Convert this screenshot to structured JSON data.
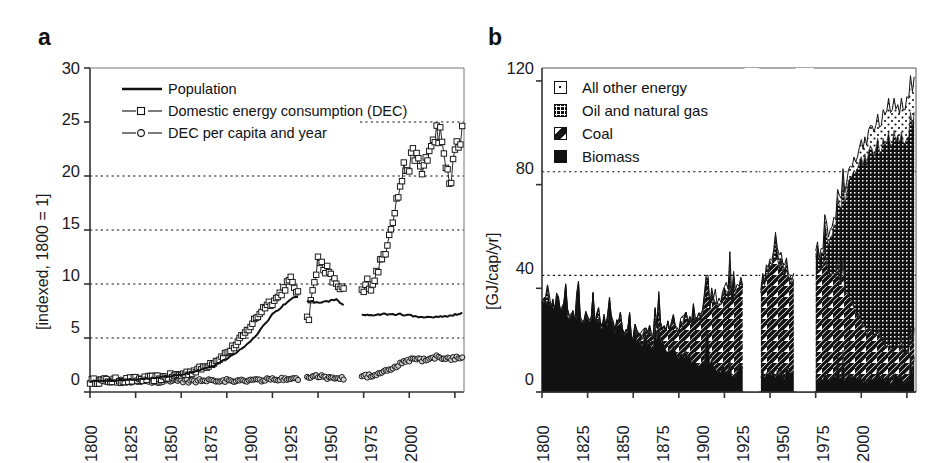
{
  "figure": {
    "panels": [
      {
        "label": "a"
      },
      {
        "label": "b"
      }
    ]
  },
  "chart_data": [
    {
      "panel": "a",
      "type": "line",
      "title": "",
      "xlabel": "",
      "ylabel": "[indexed, 1800 = 1]",
      "xlim": [
        1800,
        2005
      ],
      "ylim": [
        0,
        30
      ],
      "xticks": [
        1800,
        1825,
        1850,
        1875,
        1900,
        1925,
        1950,
        1975,
        2000
      ],
      "yticks": [
        0,
        5,
        10,
        15,
        20,
        25,
        30
      ],
      "grid": "horizontal dotted at 5, 10, 15, 20, 25",
      "legend_position": "top-left inside",
      "series": [
        {
          "name": "Population",
          "marker": "none",
          "style": "solid line",
          "x": [
            1800,
            1810,
            1820,
            1830,
            1840,
            1850,
            1860,
            1870,
            1880,
            1890,
            1900,
            1910,
            1913,
            1920,
            1925,
            1930,
            1935,
            1938,
            1950,
            1955,
            1960,
            1965,
            1970,
            1975,
            1980,
            1985,
            1990,
            1995,
            2000,
            2004
          ],
          "values": [
            1.0,
            1.05,
            1.12,
            1.22,
            1.38,
            1.6,
            2.0,
            2.6,
            3.6,
            5.0,
            7.2,
            8.6,
            8.9,
            8.4,
            8.3,
            8.4,
            8.6,
            8.1,
            7.1,
            7.15,
            7.2,
            7.2,
            7.2,
            7.1,
            6.95,
            6.9,
            6.95,
            7.0,
            7.15,
            7.35
          ]
        },
        {
          "name": "Domestic energy consumption (DEC)",
          "marker": "open square",
          "style": "line with markers",
          "x": [
            1800,
            1810,
            1820,
            1830,
            1840,
            1850,
            1860,
            1870,
            1875,
            1880,
            1885,
            1890,
            1893,
            1896,
            1899,
            1902,
            1905,
            1908,
            1910,
            1913,
            1920,
            1922,
            1924,
            1925,
            1926,
            1928,
            1930,
            1932,
            1934,
            1936,
            1938,
            1950,
            1952,
            1954,
            1956,
            1958,
            1960,
            1962,
            1964,
            1966,
            1968,
            1970,
            1972,
            1974,
            1976,
            1978,
            1980,
            1982,
            1984,
            1986,
            1988,
            1990,
            1992,
            1994,
            1996,
            1998,
            2000,
            2002,
            2004
          ],
          "values": [
            1.0,
            1.05,
            1.1,
            1.2,
            1.35,
            1.6,
            2.1,
            3.0,
            3.6,
            4.4,
            5.4,
            6.6,
            7.3,
            8.0,
            8.3,
            8.6,
            9.3,
            10.0,
            10.3,
            9.5,
            6.8,
            9.8,
            10.6,
            12.3,
            12.1,
            11.6,
            11.3,
            10.6,
            10.2,
            9.9,
            9.5,
            9.3,
            10.2,
            9.7,
            10.5,
            11.5,
            12.2,
            13.2,
            14.8,
            16.2,
            17.6,
            19.0,
            20.6,
            20.9,
            21.3,
            22.3,
            21.0,
            20.3,
            21.6,
            22.2,
            22.8,
            24.2,
            23.8,
            21.4,
            20.4,
            19.3,
            22.5,
            23.0,
            23.8
          ]
        },
        {
          "name": "DEC per capita and year",
          "marker": "open circle",
          "style": "line with markers",
          "x": [
            1800,
            1810,
            1820,
            1830,
            1840,
            1850,
            1860,
            1870,
            1880,
            1890,
            1900,
            1910,
            1913,
            1920,
            1925,
            1930,
            1935,
            1938,
            1950,
            1955,
            1960,
            1965,
            1970,
            1975,
            1980,
            1985,
            1990,
            1995,
            2000,
            2004
          ],
          "values": [
            1.0,
            1.0,
            1.0,
            1.0,
            1.0,
            1.0,
            1.05,
            1.12,
            1.0,
            1.1,
            1.15,
            1.2,
            1.2,
            1.3,
            1.5,
            1.35,
            1.3,
            1.25,
            1.45,
            1.55,
            1.75,
            2.1,
            2.6,
            2.95,
            3.0,
            2.95,
            3.25,
            3.05,
            3.15,
            3.3
          ]
        }
      ]
    },
    {
      "panel": "b",
      "type": "area",
      "subtype": "stacked area",
      "title": "",
      "xlabel": "",
      "ylabel": "[GJ/cap/yr]",
      "xlim": [
        1800,
        2005
      ],
      "ylim": [
        0,
        125
      ],
      "xticks": [
        1800,
        1825,
        1850,
        1875,
        1900,
        1925,
        1950,
        1975,
        2000
      ],
      "yticks": [
        0,
        40,
        80,
        120
      ],
      "grid": "horizontal dotted at 45 and 85",
      "legend_position": "top-left inside",
      "data_gaps": [
        [
          1911,
          1919
        ],
        [
          1939,
          1949
        ]
      ],
      "series": [
        {
          "name": "Biomass",
          "pattern": "solid black",
          "x": [
            1800,
            1805,
            1810,
            1815,
            1820,
            1825,
            1830,
            1835,
            1840,
            1845,
            1850,
            1855,
            1860,
            1865,
            1870,
            1875,
            1880,
            1885,
            1890,
            1895,
            1900,
            1905,
            1910,
            1920,
            1925,
            1930,
            1935,
            1938,
            1950,
            1955,
            1960,
            1965,
            1970,
            1975,
            1980,
            1985,
            1990,
            1995,
            2000,
            2004
          ],
          "values": [
            36,
            34,
            33,
            30,
            29,
            28,
            27,
            26,
            25,
            23,
            21,
            20,
            19,
            18,
            16,
            15,
            13,
            12,
            11,
            10,
            9,
            8,
            8,
            7,
            7,
            7,
            7,
            7,
            6,
            6,
            6,
            5.5,
            5.5,
            5,
            5,
            5,
            5,
            5,
            5,
            5
          ]
        },
        {
          "name": "Coal",
          "pattern": "diagonal hatch",
          "x": [
            1800,
            1810,
            1820,
            1830,
            1840,
            1850,
            1855,
            1860,
            1865,
            1870,
            1875,
            1880,
            1885,
            1890,
            1895,
            1900,
            1905,
            1910,
            1920,
            1925,
            1928,
            1930,
            1935,
            1938,
            1950,
            1955,
            1960,
            1965,
            1970,
            1975,
            1980,
            1985,
            1990,
            1995,
            2000,
            2004
          ],
          "values": [
            0,
            0,
            0,
            0,
            0,
            1,
            2,
            4,
            6,
            8,
            11,
            14,
            17,
            20,
            24,
            28,
            30,
            32,
            33,
            40,
            45,
            42,
            36,
            34,
            42,
            43,
            40,
            34,
            28,
            22,
            18,
            15,
            13,
            11,
            10,
            10
          ]
        },
        {
          "name": "Oil and natural gas",
          "pattern": "dense dot grid",
          "x": [
            1800,
            1850,
            1900,
            1910,
            1920,
            1930,
            1938,
            1950,
            1955,
            1960,
            1965,
            1970,
            1975,
            1980,
            1985,
            1990,
            1995,
            2000,
            2004
          ],
          "values": [
            0,
            0,
            0.5,
            1,
            1,
            2,
            2,
            3,
            8,
            18,
            32,
            50,
            62,
            70,
            72,
            80,
            78,
            82,
            84
          ]
        },
        {
          "name": "All other energy",
          "pattern": "sparse dots",
          "x": [
            1800,
            1850,
            1900,
            1910,
            1920,
            1930,
            1938,
            1950,
            1960,
            1970,
            1975,
            1980,
            1985,
            1990,
            1995,
            2000,
            2004
          ],
          "values": [
            0,
            0,
            1,
            1,
            1,
            1.5,
            1.5,
            2,
            3,
            4,
            6,
            8,
            10,
            13,
            12,
            14,
            14
          ]
        }
      ]
    }
  ],
  "panel_a": {
    "label": "a",
    "ylabel": "[indexed, 1800 = 1]",
    "yticks": [
      "0",
      "5",
      "10",
      "15",
      "20",
      "25",
      "30"
    ],
    "xticks": [
      "1800",
      "1825",
      "1850",
      "1875",
      "1900",
      "1925",
      "1950",
      "1975",
      "2000"
    ],
    "legend": [
      {
        "label": "Population",
        "key": "solid-line"
      },
      {
        "label": "Domestic energy consumption (DEC)",
        "key": "line-square-marker"
      },
      {
        "label": "DEC per capita and year",
        "key": "line-circle-marker"
      }
    ]
  },
  "panel_b": {
    "label": "b",
    "ylabel": "[GJ/cap/yr]",
    "yticks": [
      "0",
      "40",
      "80",
      "120"
    ],
    "xticks": [
      "1800",
      "1825",
      "1850",
      "1875",
      "1900",
      "1925",
      "1950",
      "1975",
      "2000"
    ],
    "legend": [
      {
        "label": "All other energy",
        "key": "sparse-dots-swatch"
      },
      {
        "label": "Oil and natural gas",
        "key": "dense-dots-swatch"
      },
      {
        "label": "Coal",
        "key": "diagonal-hatch-swatch"
      },
      {
        "label": "Biomass",
        "key": "solid-black-swatch"
      }
    ]
  }
}
